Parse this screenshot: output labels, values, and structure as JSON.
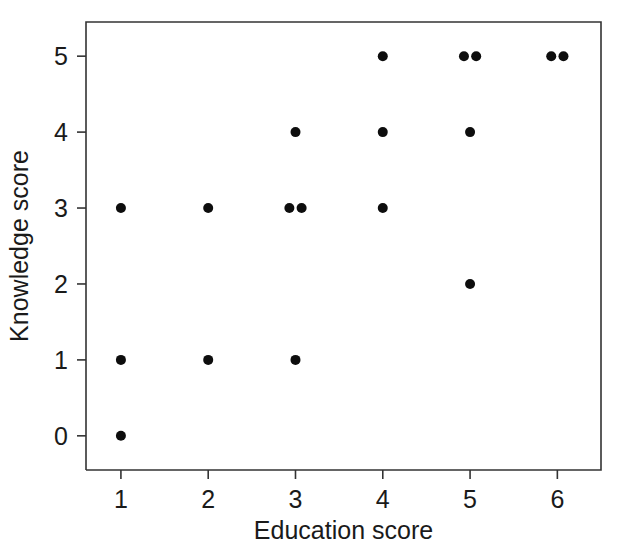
{
  "chart_data": {
    "type": "scatter",
    "title": "",
    "xlabel": "Education score",
    "ylabel": "Knowledge score",
    "xlim": [
      0.6,
      6.5
    ],
    "ylim": [
      -0.45,
      5.45
    ],
    "xticks": [
      1,
      2,
      3,
      4,
      5,
      6
    ],
    "yticks": [
      0,
      1,
      2,
      3,
      4,
      5
    ],
    "xtick_labels": [
      "1",
      "2",
      "3",
      "4",
      "5",
      "6"
    ],
    "ytick_labels": [
      "0",
      "1",
      "2",
      "3",
      "4",
      "5"
    ],
    "grid": false,
    "legend": null,
    "marker": "filled-circle",
    "marker_color": "#0d0d0d",
    "marker_size_px": 5,
    "n_points": 17,
    "points": [
      {
        "x": 1,
        "y": 0,
        "jitter_x": 0.0
      },
      {
        "x": 1,
        "y": 1,
        "jitter_x": 0.0
      },
      {
        "x": 1,
        "y": 3,
        "jitter_x": 0.0
      },
      {
        "x": 2,
        "y": 1,
        "jitter_x": 0.0
      },
      {
        "x": 2,
        "y": 3,
        "jitter_x": 0.0
      },
      {
        "x": 3,
        "y": 1,
        "jitter_x": 0.0
      },
      {
        "x": 3,
        "y": 3,
        "jitter_x": -0.07
      },
      {
        "x": 3,
        "y": 3,
        "jitter_x": 0.07
      },
      {
        "x": 3,
        "y": 4,
        "jitter_x": 0.0
      },
      {
        "x": 4,
        "y": 3,
        "jitter_x": 0.0
      },
      {
        "x": 4,
        "y": 4,
        "jitter_x": 0.0
      },
      {
        "x": 4,
        "y": 5,
        "jitter_x": 0.0
      },
      {
        "x": 5,
        "y": 2,
        "jitter_x": 0.0
      },
      {
        "x": 5,
        "y": 4,
        "jitter_x": 0.0
      },
      {
        "x": 5,
        "y": 5,
        "jitter_x": -0.07
      },
      {
        "x": 5,
        "y": 5,
        "jitter_x": 0.07
      },
      {
        "x": 6,
        "y": 5,
        "jitter_x": -0.07
      },
      {
        "x": 6,
        "y": 5,
        "jitter_x": 0.07
      }
    ],
    "x": [
      1,
      1,
      1,
      2,
      2,
      3,
      3,
      3,
      3,
      4,
      4,
      4,
      5,
      5,
      5,
      5,
      6,
      6
    ],
    "y": [
      0,
      1,
      3,
      1,
      3,
      1,
      3,
      3,
      4,
      3,
      4,
      5,
      2,
      4,
      5,
      5,
      5,
      5
    ],
    "colors": {
      "marker": "#0d0d0d",
      "axis": "#333333",
      "text": "#1a1a1a",
      "background": "#ffffff"
    }
  },
  "figure": {
    "plot_area": {
      "left": 86,
      "top": 22,
      "right": 601,
      "bottom": 470
    },
    "axis_x_title": "Education score",
    "axis_y_title": "Knowledge score"
  }
}
